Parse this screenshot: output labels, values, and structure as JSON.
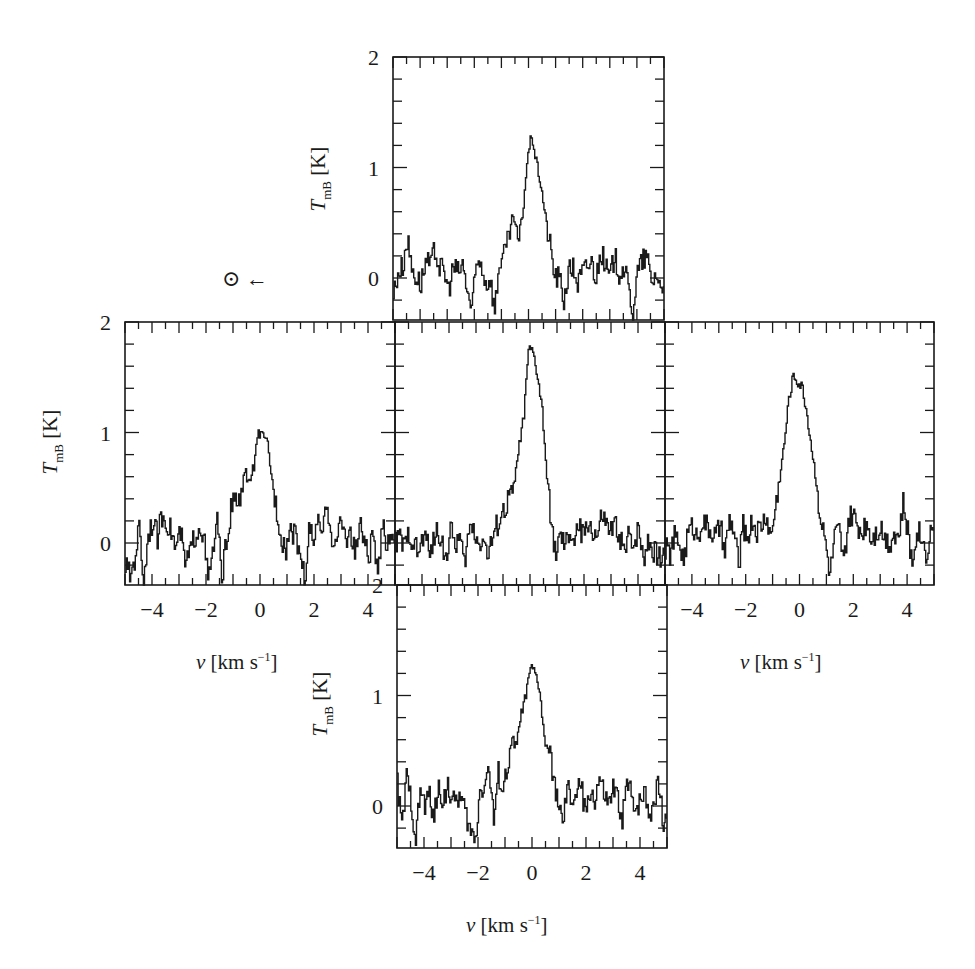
{
  "figure": {
    "sun_marker": "⊙ ←",
    "y_axis_label_main": "T",
    "y_axis_label_sub": "mB",
    "y_axis_label_unit": " [K]",
    "x_axis_label_main": "v",
    "x_axis_label_unit": " [km s",
    "x_axis_label_exp": "−1",
    "x_axis_label_close": "]",
    "y_ticks": [
      "0",
      "1",
      "2"
    ],
    "x_ticks": [
      "−4",
      "−2",
      "0",
      "2",
      "4"
    ]
  },
  "chart_data": [
    {
      "type": "line",
      "panel": "top",
      "title": "",
      "xlabel": "",
      "ylabel": "T_mB [K]",
      "xlim": [
        -5,
        5
      ],
      "ylim": [
        -0.38,
        2
      ],
      "x": [
        -5.0,
        -4.83,
        -4.66,
        -4.49,
        -4.32,
        -4.15,
        -3.98,
        -3.81,
        -3.64,
        -3.47,
        -3.3,
        -3.13,
        -2.96,
        -2.79,
        -2.62,
        -2.45,
        -2.28,
        -2.11,
        -1.94,
        -1.77,
        -1.6,
        -1.43,
        -1.26,
        -1.09,
        -0.92,
        -0.75,
        -0.58,
        -0.41,
        -0.24,
        -0.07,
        0.1,
        0.27,
        0.44,
        0.61,
        0.78,
        0.95,
        1.12,
        1.29,
        1.46,
        1.63,
        1.8,
        1.97,
        2.14,
        2.31,
        2.48,
        2.65,
        2.82,
        2.99,
        3.16,
        3.33,
        3.5,
        3.67,
        3.84,
        4.01,
        4.18,
        4.35,
        4.52,
        4.69,
        4.86,
        5.0
      ],
      "values": [
        -0.15,
        0.05,
        0.1,
        0.35,
        0.1,
        0.0,
        -0.05,
        0.15,
        0.1,
        0.25,
        0.1,
        0.05,
        -0.1,
        0.1,
        0.05,
        0.12,
        -0.1,
        -0.3,
        0.1,
        0.15,
        -0.05,
        0.0,
        -0.3,
        0.15,
        0.2,
        0.35,
        0.58,
        0.3,
        0.55,
        1.05,
        1.3,
        1.05,
        0.85,
        0.55,
        0.3,
        0.02,
        0.0,
        -0.2,
        0.05,
        0.1,
        -0.05,
        0.05,
        0.1,
        0.15,
        0.0,
        0.25,
        0.1,
        0.0,
        0.2,
        0.05,
        0.1,
        -0.1,
        -0.3,
        0.05,
        0.15,
        0.2,
        -0.05,
        0.05,
        -0.1,
        0.0
      ]
    },
    {
      "type": "line",
      "panel": "left",
      "xlabel": "v [km s^-1]",
      "ylabel": "T_mB [K]",
      "xlim": [
        -5,
        5
      ],
      "ylim": [
        -0.38,
        2
      ],
      "x": [
        -5.0,
        -4.83,
        -4.66,
        -4.49,
        -4.32,
        -4.15,
        -3.98,
        -3.81,
        -3.64,
        -3.47,
        -3.3,
        -3.13,
        -2.96,
        -2.79,
        -2.62,
        -2.45,
        -2.28,
        -2.11,
        -1.94,
        -1.77,
        -1.6,
        -1.43,
        -1.26,
        -1.09,
        -0.92,
        -0.75,
        -0.58,
        -0.41,
        -0.24,
        -0.07,
        0.1,
        0.27,
        0.44,
        0.61,
        0.78,
        0.95,
        1.12,
        1.29,
        1.46,
        1.63,
        1.8,
        1.97,
        2.14,
        2.31,
        2.48,
        2.65,
        2.82,
        2.99,
        3.16,
        3.33,
        3.5,
        3.67,
        3.84,
        4.01,
        4.18,
        4.35,
        4.52,
        4.69,
        4.86,
        5.0
      ],
      "values": [
        -0.2,
        -0.3,
        -0.15,
        0.15,
        -0.35,
        0.1,
        0.2,
        0.05,
        0.25,
        0.2,
        0.1,
        -0.05,
        0.1,
        -0.2,
        -0.1,
        0.05,
        0.15,
        0.1,
        -0.35,
        -0.1,
        0.2,
        -0.3,
        0.0,
        0.3,
        0.4,
        0.35,
        0.65,
        0.55,
        0.7,
        1.0,
        0.95,
        0.9,
        0.55,
        0.3,
        0.05,
        -0.05,
        0.15,
        0.05,
        -0.05,
        -0.35,
        0.1,
        0.05,
        0.15,
        0.1,
        0.35,
        0.05,
        0.0,
        0.2,
        0.05,
        0.1,
        -0.1,
        0.15,
        0.05,
        -0.15,
        0.1,
        -0.35,
        0.15,
        0.0,
        0.1,
        0.05
      ]
    },
    {
      "type": "line",
      "panel": "center",
      "xlabel": "",
      "ylabel": "",
      "xlim": [
        -5,
        5
      ],
      "ylim": [
        -0.38,
        2
      ],
      "x": [
        -5.0,
        -4.83,
        -4.66,
        -4.49,
        -4.32,
        -4.15,
        -3.98,
        -3.81,
        -3.64,
        -3.47,
        -3.3,
        -3.13,
        -2.96,
        -2.79,
        -2.62,
        -2.45,
        -2.28,
        -2.11,
        -1.94,
        -1.77,
        -1.6,
        -1.43,
        -1.26,
        -1.09,
        -0.92,
        -0.75,
        -0.58,
        -0.41,
        -0.24,
        -0.07,
        0.1,
        0.27,
        0.44,
        0.61,
        0.78,
        0.95,
        1.12,
        1.29,
        1.46,
        1.63,
        1.8,
        1.97,
        2.14,
        2.31,
        2.48,
        2.65,
        2.82,
        2.99,
        3.16,
        3.33,
        3.5,
        3.67,
        3.84,
        4.01,
        4.18,
        4.35,
        4.52,
        4.69,
        4.86,
        5.0
      ],
      "values": [
        0.0,
        0.05,
        -0.05,
        0.1,
        0.0,
        -0.1,
        0.05,
        0.0,
        -0.05,
        0.1,
        0.05,
        -0.15,
        0.1,
        0.0,
        0.05,
        -0.2,
        0.1,
        0.15,
        0.0,
        0.05,
        -0.1,
        0.0,
        0.15,
        0.25,
        0.3,
        0.45,
        0.55,
        0.9,
        1.15,
        1.75,
        1.72,
        1.5,
        1.2,
        0.6,
        0.15,
        -0.1,
        0.05,
        -0.05,
        0.1,
        0.0,
        0.15,
        0.05,
        0.2,
        0.1,
        0.05,
        0.25,
        0.15,
        0.1,
        0.15,
        0.05,
        -0.1,
        0.1,
        0.0,
        0.15,
        -0.15,
        0.05,
        -0.05,
        -0.1,
        -0.15,
        0.0
      ]
    },
    {
      "type": "line",
      "panel": "right",
      "xlabel": "v [km s^-1]",
      "ylabel": "",
      "xlim": [
        -5,
        5
      ],
      "ylim": [
        -0.38,
        2
      ],
      "x": [
        -5.0,
        -4.83,
        -4.66,
        -4.49,
        -4.32,
        -4.15,
        -3.98,
        -3.81,
        -3.64,
        -3.47,
        -3.3,
        -3.13,
        -2.96,
        -2.79,
        -2.62,
        -2.45,
        -2.28,
        -2.11,
        -1.94,
        -1.77,
        -1.6,
        -1.43,
        -1.26,
        -1.09,
        -0.92,
        -0.75,
        -0.58,
        -0.41,
        -0.24,
        -0.07,
        0.1,
        0.27,
        0.44,
        0.61,
        0.78,
        0.95,
        1.12,
        1.29,
        1.46,
        1.63,
        1.8,
        1.97,
        2.14,
        2.31,
        2.48,
        2.65,
        2.82,
        2.99,
        3.16,
        3.33,
        3.5,
        3.67,
        3.84,
        4.01,
        4.18,
        4.35,
        4.52,
        4.69,
        4.86,
        5.0
      ],
      "values": [
        -0.05,
        -0.1,
        0.05,
        0.0,
        -0.15,
        0.1,
        0.15,
        0.05,
        0.2,
        0.15,
        0.1,
        0.05,
        0.15,
        -0.1,
        0.2,
        0.1,
        -0.2,
        0.15,
        0.05,
        0.2,
        0.1,
        0.15,
        0.25,
        0.05,
        0.3,
        0.6,
        0.9,
        1.3,
        1.52,
        1.45,
        1.4,
        1.15,
        0.85,
        0.55,
        0.2,
        0.0,
        -0.3,
        0.05,
        0.1,
        -0.2,
        0.2,
        0.25,
        0.15,
        0.1,
        0.2,
        0.05,
        0.1,
        0.15,
        0.05,
        0.0,
        0.1,
        0.05,
        0.35,
        0.1,
        -0.2,
        0.15,
        0.05,
        -0.1,
        0.1,
        0.2
      ]
    },
    {
      "type": "line",
      "panel": "bottom",
      "xlabel": "v [km s^-1]",
      "ylabel": "T_mB [K]",
      "xlim": [
        -5,
        5
      ],
      "ylim": [
        -0.38,
        2
      ],
      "x": [
        -5.0,
        -4.83,
        -4.66,
        -4.49,
        -4.32,
        -4.15,
        -3.98,
        -3.81,
        -3.64,
        -3.47,
        -3.3,
        -3.13,
        -2.96,
        -2.79,
        -2.62,
        -2.45,
        -2.28,
        -2.11,
        -1.94,
        -1.77,
        -1.6,
        -1.43,
        -1.26,
        -1.09,
        -0.92,
        -0.75,
        -0.58,
        -0.41,
        -0.24,
        -0.07,
        0.1,
        0.27,
        0.44,
        0.61,
        0.78,
        0.95,
        1.12,
        1.29,
        1.46,
        1.63,
        1.8,
        1.97,
        2.14,
        2.31,
        2.48,
        2.65,
        2.82,
        2.99,
        3.16,
        3.33,
        3.5,
        3.67,
        3.84,
        4.01,
        4.18,
        4.35,
        4.52,
        4.69,
        4.86,
        5.0
      ],
      "values": [
        0.2,
        -0.2,
        0.25,
        0.05,
        -0.3,
        0.15,
        0.0,
        0.1,
        -0.1,
        0.15,
        0.05,
        0.2,
        0.0,
        0.1,
        0.05,
        -0.1,
        -0.25,
        -0.3,
        0.15,
        0.2,
        0.35,
        -0.15,
        0.3,
        0.15,
        0.35,
        0.6,
        0.55,
        0.85,
        1.0,
        1.25,
        1.2,
        1.05,
        0.6,
        0.5,
        0.25,
        0.05,
        -0.2,
        0.15,
        0.05,
        0.1,
        0.2,
        -0.1,
        0.15,
        0.05,
        0.25,
        0.1,
        0.0,
        0.15,
        0.05,
        -0.1,
        0.2,
        0.1,
        0.0,
        0.05,
        0.15,
        -0.1,
        0.1,
        0.2,
        -0.2,
        0.0
      ]
    }
  ]
}
